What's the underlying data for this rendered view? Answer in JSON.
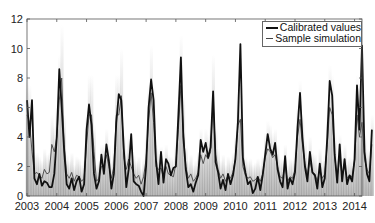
{
  "chart_data": {
    "type": "line",
    "title": "",
    "xlabel": "",
    "ylabel": "",
    "xlim": [
      2003,
      2014.25
    ],
    "ylim": [
      0,
      12
    ],
    "x_ticks": [
      "2003",
      "2004",
      "2005",
      "2006",
      "2007",
      "2008",
      "2009",
      "2010",
      "2011",
      "2012",
      "2013",
      "2014"
    ],
    "y_ticks": [
      "0",
      "2",
      "4",
      "6",
      "8",
      "10",
      "12"
    ],
    "grid": false,
    "legend_position": "top-right",
    "legend": [
      "Calibrated values",
      "Sample simulation"
    ],
    "x_step": "monthly",
    "x_start": 2003.0,
    "series": [
      {
        "name": "Calibrated values",
        "color": "#111111",
        "width": 2,
        "values": [
          6.5,
          4.0,
          6.5,
          1.2,
          0.8,
          1.5,
          0.7,
          1.0,
          0.9,
          0.6,
          0.6,
          1.5,
          4.0,
          8.6,
          6.0,
          3.0,
          0.8,
          0.5,
          1.2,
          0.4,
          1.0,
          1.3,
          0.3,
          0.8,
          4.5,
          6.2,
          4.8,
          1.5,
          0.5,
          1.0,
          2.8,
          1.5,
          3.5,
          2.4,
          0.5,
          1.5,
          5.0,
          6.9,
          6.5,
          3.2,
          0.6,
          1.8,
          4.2,
          1.0,
          0.8,
          0.7,
          0.3,
          0.0,
          2.0,
          6.0,
          7.9,
          6.5,
          2.4,
          0.8,
          3.0,
          0.9,
          2.5,
          2.2,
          1.4,
          1.9,
          2.0,
          5.5,
          9.4,
          4.0,
          1.8,
          0.6,
          0.8,
          0.3,
          0.9,
          1.4,
          3.8,
          3.0,
          3.6,
          2.6,
          3.3,
          7.1,
          2.3,
          1.6,
          0.5,
          1.1,
          0.4,
          1.5,
          0.8,
          1.4,
          2.5,
          5.0,
          10.3,
          2.6,
          1.6,
          0.8,
          1.0,
          0.2,
          0.5,
          1.3,
          0.4,
          1.4,
          2.8,
          4.2,
          3.2,
          2.8,
          3.6,
          1.8,
          1.0,
          0.6,
          2.7,
          0.5,
          1.2,
          0.8,
          1.6,
          4.6,
          7.0,
          4.0,
          2.0,
          1.0,
          3.0,
          1.6,
          1.4,
          0.5,
          2.2,
          0.6,
          1.2,
          4.0,
          7.8,
          6.8,
          2.8,
          0.9,
          3.5,
          1.0,
          2.5,
          0.8,
          1.4,
          1.0,
          2.5,
          7.5,
          4.5,
          10.2,
          3.0,
          1.5,
          1.0,
          4.5
        ]
      },
      {
        "name": "Sample simulation",
        "color": "#444444",
        "width": 1,
        "values": [
          5.5,
          5.0,
          3.0,
          1.5,
          1.6,
          1.4,
          1.2,
          1.8,
          1.5,
          1.6,
          3.5,
          3.0,
          4.0,
          6.5,
          8.0,
          3.5,
          1.5,
          1.2,
          1.6,
          1.0,
          1.4,
          1.3,
          1.0,
          1.2,
          3.5,
          5.5,
          5.5,
          3.0,
          1.0,
          1.2,
          2.0,
          2.0,
          2.8,
          2.0,
          1.2,
          2.0,
          5.5,
          5.5,
          6.8,
          2.6,
          1.8,
          2.5,
          2.0,
          1.5,
          1.2,
          1.4,
          0.8,
          1.3,
          2.5,
          5.0,
          7.0,
          5.0,
          2.0,
          1.8,
          1.9,
          1.2,
          2.0,
          1.5,
          1.4,
          1.3,
          2.2,
          4.5,
          7.5,
          4.5,
          2.0,
          1.2,
          1.5,
          1.0,
          1.2,
          1.6,
          2.8,
          2.2,
          2.8,
          2.5,
          3.0,
          6.5,
          2.8,
          1.8,
          1.2,
          1.5,
          1.0,
          1.4,
          1.2,
          1.6,
          2.5,
          4.8,
          5.2,
          2.0,
          1.4,
          1.2,
          1.3,
          1.0,
          1.1,
          1.3,
          1.0,
          1.5,
          2.6,
          3.2,
          3.0,
          2.6,
          2.8,
          2.0,
          1.3,
          1.2,
          2.0,
          1.0,
          1.3,
          1.2,
          1.8,
          4.0,
          5.2,
          3.5,
          2.2,
          1.4,
          2.4,
          1.6,
          1.5,
          1.0,
          1.8,
          1.2,
          1.5,
          3.5,
          6.0,
          5.5,
          2.6,
          1.3,
          2.5,
          1.4,
          2.0,
          1.2,
          1.4,
          1.3,
          2.4,
          5.5,
          4.0,
          5.0,
          2.5,
          1.8,
          1.5,
          3.5
        ]
      }
    ],
    "ensemble_band": {
      "description": "grey shaded ensemble of simulations, darker near median, fading toward extremes; seasonal peaks to ~9-10",
      "color": "#808080"
    }
  }
}
